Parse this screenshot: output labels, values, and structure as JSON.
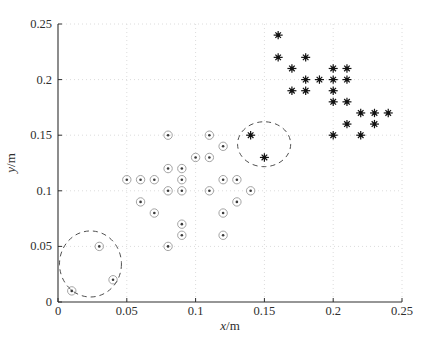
{
  "figure": {
    "background": "#ffffff"
  },
  "chart_data": {
    "type": "scatter",
    "title": "",
    "xlabel": "x/m",
    "ylabel": "y/m",
    "xlim": [
      0,
      0.25
    ],
    "ylim": [
      0,
      0.25
    ],
    "xtick_values": [
      0,
      0.05,
      0.1,
      0.15,
      0.2,
      0.25
    ],
    "xtick_labels": [
      "0",
      "0.05",
      "0.1",
      "0.15",
      "0.2",
      "0.25"
    ],
    "ytick_values": [
      0,
      0.05,
      0.1,
      0.15,
      0.2,
      0.25
    ],
    "ytick_labels": [
      "0",
      "0.05",
      "0.1",
      "0.15",
      "0.2",
      "0.25"
    ],
    "grid": "dotted",
    "legend": "none",
    "colors": {
      "axis": "#2e2e2e",
      "grid": "#dcdcdc",
      "circle_marker_ring": "#a3a3a3",
      "circle_marker_dot": "#3a3a3a",
      "star_marker": "#111111",
      "dashed_ellipse": "#4f4f4f"
    },
    "series": [
      {
        "name": "circled-dot points (lower-left cluster)",
        "marker": "circle-dot",
        "points": [
          [
            0.01,
            0.01
          ],
          [
            0.03,
            0.05
          ],
          [
            0.04,
            0.02
          ],
          [
            0.05,
            0.11
          ],
          [
            0.06,
            0.11
          ],
          [
            0.06,
            0.09
          ],
          [
            0.07,
            0.11
          ],
          [
            0.07,
            0.08
          ],
          [
            0.08,
            0.15
          ],
          [
            0.08,
            0.12
          ],
          [
            0.08,
            0.1
          ],
          [
            0.08,
            0.05
          ],
          [
            0.09,
            0.12
          ],
          [
            0.09,
            0.11
          ],
          [
            0.09,
            0.1
          ],
          [
            0.09,
            0.07
          ],
          [
            0.09,
            0.06
          ],
          [
            0.1,
            0.13
          ],
          [
            0.11,
            0.15
          ],
          [
            0.11,
            0.13
          ],
          [
            0.11,
            0.1
          ],
          [
            0.12,
            0.14
          ],
          [
            0.12,
            0.11
          ],
          [
            0.12,
            0.08
          ],
          [
            0.12,
            0.06
          ],
          [
            0.13,
            0.11
          ],
          [
            0.13,
            0.09
          ],
          [
            0.14,
            0.1
          ]
        ]
      },
      {
        "name": "star points (upper-right cluster)",
        "marker": "star",
        "points": [
          [
            0.14,
            0.15
          ],
          [
            0.15,
            0.13
          ],
          [
            0.16,
            0.24
          ],
          [
            0.16,
            0.22
          ],
          [
            0.17,
            0.21
          ],
          [
            0.17,
            0.19
          ],
          [
            0.18,
            0.22
          ],
          [
            0.18,
            0.2
          ],
          [
            0.18,
            0.19
          ],
          [
            0.19,
            0.2
          ],
          [
            0.2,
            0.21
          ],
          [
            0.2,
            0.2
          ],
          [
            0.2,
            0.19
          ],
          [
            0.2,
            0.18
          ],
          [
            0.2,
            0.15
          ],
          [
            0.21,
            0.21
          ],
          [
            0.21,
            0.2
          ],
          [
            0.21,
            0.18
          ],
          [
            0.21,
            0.16
          ],
          [
            0.22,
            0.17
          ],
          [
            0.22,
            0.15
          ],
          [
            0.23,
            0.17
          ],
          [
            0.23,
            0.16
          ],
          [
            0.24,
            0.17
          ]
        ]
      }
    ],
    "annotations": [
      {
        "type": "dashed-ellipse",
        "label": "lower-left highlighted cluster",
        "center": [
          0.0236,
          0.0342
        ],
        "rx": 0.0225,
        "ry": 0.0297
      },
      {
        "type": "dashed-ellipse",
        "label": "mid highlighted cluster",
        "center": [
          0.1498,
          0.1419
        ],
        "rx": 0.0193,
        "ry": 0.0202
      }
    ]
  }
}
